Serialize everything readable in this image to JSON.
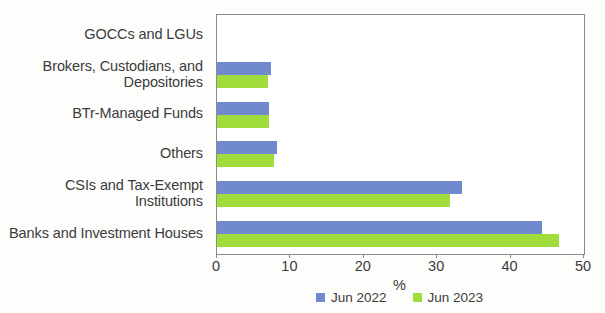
{
  "chart_data": {
    "type": "bar",
    "orientation": "horizontal",
    "title": "",
    "subtitle": "",
    "xlabel": "%",
    "ylabel": "",
    "xlim": [
      0,
      50
    ],
    "xticks": [
      0,
      10,
      20,
      30,
      40,
      50
    ],
    "xtick_labels": [
      "0",
      "10",
      "20",
      "30",
      "40",
      "50"
    ],
    "grid": false,
    "legend_position": "bottom-center",
    "categories": [
      "GOCCs and LGUs",
      "Brokers, Custodians, and Depositories",
      "BTr-Managed Funds",
      "Others",
      "CSIs and Tax-Exempt Institutions",
      "Banks and Investment Houses"
    ],
    "series": [
      {
        "name": "Jun 2022",
        "color": "#7189cd",
        "values": [
          0.0,
          7.3,
          7.1,
          8.2,
          33.4,
          44.3
        ]
      },
      {
        "name": "Jun 2023",
        "color": "#9fdc3c",
        "values": [
          0.0,
          6.9,
          7.1,
          7.8,
          31.7,
          46.6
        ]
      }
    ]
  },
  "legend": {
    "items": [
      {
        "label": "Jun 2022",
        "color": "#7189cd"
      },
      {
        "label": "Jun 2023",
        "color": "#9fdc3c"
      }
    ]
  },
  "axis": {
    "x_title": "%"
  }
}
